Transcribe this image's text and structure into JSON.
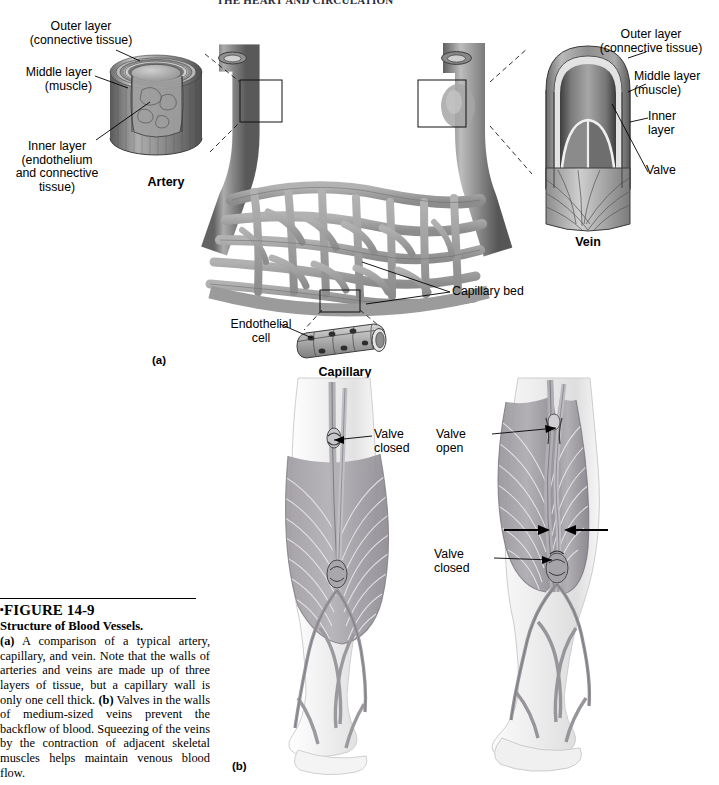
{
  "page": {
    "running_head": "THE HEART AND CIRCULATION",
    "background": "#ffffff"
  },
  "figure": {
    "number": "FIGURE 14-9",
    "bullet": "▪",
    "title": "Structure of Blood Vessels.",
    "caption_a_tag": "(a)",
    "caption_a_text": " A comparison of a typical artery, capillary, and vein. Note that the walls of arteries and veins are made up of three layers of tissue, but a capillary wall is only one cell thick. ",
    "caption_b_tag": "(b)",
    "caption_b_text": " Valves in the walls of medium-sized veins prevent the backflow of blood. Squeezing of the veins by the contraction of adjacent skeletal muscles helps maintain venous blood flow."
  },
  "panels": {
    "a_label": "(a)",
    "b_label": "(b)"
  },
  "artery": {
    "name": "Artery",
    "labels": {
      "outer": "Outer layer\n(connective tissue)",
      "middle": "Middle layer\n(muscle)",
      "inner": "Inner layer\n(endothelium\nand connective\ntissue)"
    }
  },
  "vein": {
    "name": "Vein",
    "labels": {
      "outer": "Outer layer\n(connective tissue)",
      "middle": "Middle layer\n(muscle)",
      "inner": "Inner\nlayer",
      "valve": "Valve"
    }
  },
  "capillary": {
    "name": "Capillary",
    "bed_label": "Capillary bed",
    "endothelial_label": "Endothelial\ncell"
  },
  "legs": {
    "left": {
      "valve_closed": "Valve\nclosed"
    },
    "right": {
      "valve_open": "Valve\nopen",
      "valve_closed": "Valve\nclosed"
    }
  },
  "colors": {
    "vessel_mid": "#9a9a9a",
    "vessel_dark": "#5e5e5e",
    "vessel_light": "#d4d4d4",
    "muscle": "#9d9a9f",
    "skin": "#efefef",
    "ink": "#000000"
  }
}
